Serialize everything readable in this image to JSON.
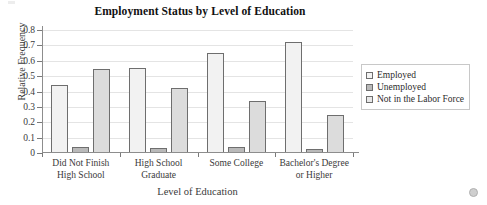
{
  "chart_data": {
    "type": "bar",
    "title": "Employment Status by Level of Education",
    "xlabel": "Level of Education",
    "ylabel": "Relative Frequency",
    "categories": [
      "Did Not Finish High School",
      "High School Graduate",
      "Some College",
      "Bachelor's Degree or Higher"
    ],
    "series": [
      {
        "name": "Employed",
        "color": "#f2f2f2",
        "values": [
          0.44,
          0.55,
          0.65,
          0.725
        ]
      },
      {
        "name": "Unemployed",
        "color": "#b9b9b9",
        "values": [
          0.04,
          0.035,
          0.04,
          0.025
        ]
      },
      {
        "name": "Not in the Labor Force",
        "color": "#dcdcdc",
        "values": [
          0.545,
          0.42,
          0.34,
          0.25
        ]
      }
    ],
    "ylim": [
      0,
      0.8
    ],
    "ytick_labels": [
      "0",
      "0.1",
      "0.2",
      "0.3",
      "0.4",
      "0.5",
      "0.6",
      "0.7",
      "0.8"
    ],
    "ytick_values": [
      0,
      0.1,
      0.2,
      0.3,
      0.4,
      0.5,
      0.6,
      0.7,
      0.8
    ],
    "grid": true,
    "legend_position": "right",
    "grouping": "grouped"
  },
  "legend": {
    "entries": [
      {
        "label": "Employed",
        "swatch": "legend-swatch-employed"
      },
      {
        "label": "Unemployed",
        "swatch": "legend-swatch-unemployed"
      },
      {
        "label": "Not in the Labor Force",
        "swatch": "legend-swatch-not-in-labor-force"
      }
    ]
  },
  "marks": {
    "corner_marker": "circle-marker"
  }
}
